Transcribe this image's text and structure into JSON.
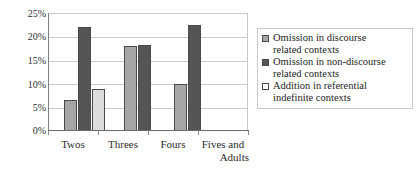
{
  "chart_data": {
    "type": "bar",
    "title": "",
    "xlabel": "",
    "ylabel": "",
    "categories": [
      "Twos",
      "Threes",
      "Fours",
      "Fives and Adults"
    ],
    "ylim": [
      0,
      25
    ],
    "ytick_labels": [
      "25%",
      "20%",
      "15%",
      "10%",
      "5%",
      "0%"
    ],
    "ytick_values": [
      25,
      20,
      15,
      10,
      5,
      0
    ],
    "grid": true,
    "legend_position": "right",
    "series": [
      {
        "name": "Omission in discourse related contexts",
        "color": "#a6a6a6",
        "values": [
          6.5,
          18.0,
          10.0,
          null
        ]
      },
      {
        "name": "Omission in non-discourse related contexts",
        "color": "#555555",
        "values": [
          22.0,
          18.2,
          22.5,
          null
        ]
      },
      {
        "name": "Addition in referential indefinite contexts",
        "color": "#ffffff",
        "values": [
          9.0,
          null,
          null,
          null
        ]
      }
    ]
  },
  "axes": {
    "y_ticks": [
      {
        "label": "25%"
      },
      {
        "label": "20%"
      },
      {
        "label": "15%"
      },
      {
        "label": "10%"
      },
      {
        "label": "5%"
      },
      {
        "label": "0%"
      }
    ],
    "x_ticks": [
      {
        "line1": "Twos",
        "line2": ""
      },
      {
        "line1": "Threes",
        "line2": ""
      },
      {
        "line1": "Fours",
        "line2": ""
      },
      {
        "line1": "Fives and",
        "line2": "Adults"
      }
    ]
  },
  "legend": {
    "items": [
      {
        "label_line1": "Omission in discourse",
        "label_line2": "related contexts",
        "swatch": "medium-gray"
      },
      {
        "label_line1": "Omission in non-discourse",
        "label_line2": "related contexts",
        "swatch": "dark-gray"
      },
      {
        "label_line1": "Addition in referential",
        "label_line2": "indefinite contexts",
        "swatch": "white"
      }
    ]
  }
}
